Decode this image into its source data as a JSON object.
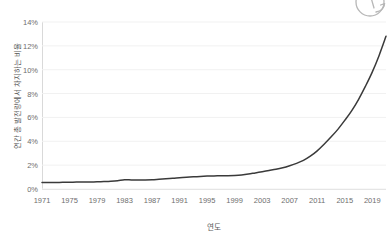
{
  "figure": {
    "background_color": "#ffffff",
    "line_color": "#3a3a3a",
    "grid_color": "#f1f1f1",
    "axis_color": "#d9d9d9",
    "tick_text_color": "#6e6e6e",
    "label_text_color": "#5a5a5a"
  },
  "icons": {
    "rotate": {
      "name": "rotate-icon",
      "label": "rotate"
    }
  },
  "chart_data": {
    "type": "line",
    "title": "",
    "subtitle": "",
    "xlabel": "연도",
    "ylabel": "연간 총 발전량에서 차지하는 비율",
    "xlim": [
      1971,
      2021
    ],
    "ylim": [
      0,
      14
    ],
    "grid": true,
    "legend": false,
    "legend_position": "none",
    "y_tick_labels": [
      "0%",
      "2%",
      "4%",
      "6%",
      "8%",
      "10%",
      "12%",
      "14%"
    ],
    "y_tick_values": [
      0,
      2,
      4,
      6,
      8,
      10,
      12,
      14
    ],
    "x_tick_labels": [
      "1971",
      "1975",
      "1979",
      "1983",
      "1987",
      "1991",
      "1995",
      "1999",
      "2003",
      "2007",
      "2011",
      "2015",
      "2019"
    ],
    "x_tick_values": [
      1971,
      1975,
      1979,
      1983,
      1987,
      1991,
      1995,
      1999,
      2003,
      2007,
      2011,
      2015,
      2019
    ],
    "series": [
      {
        "name": "연간 총 발전량에서 차지하는 비율",
        "color": "#3a3a3a",
        "x": [
          1971,
          1972,
          1973,
          1974,
          1975,
          1976,
          1977,
          1978,
          1979,
          1980,
          1981,
          1982,
          1983,
          1984,
          1985,
          1986,
          1987,
          1988,
          1989,
          1990,
          1991,
          1992,
          1993,
          1994,
          1995,
          1996,
          1997,
          1998,
          1999,
          2000,
          2001,
          2002,
          2003,
          2004,
          2005,
          2006,
          2007,
          2008,
          2009,
          2010,
          2011,
          2012,
          2013,
          2014,
          2015,
          2016,
          2017,
          2018,
          2019,
          2020,
          2021
        ],
        "values": [
          0.55,
          0.55,
          0.55,
          0.56,
          0.57,
          0.58,
          0.58,
          0.59,
          0.6,
          0.62,
          0.65,
          0.7,
          0.78,
          0.76,
          0.75,
          0.76,
          0.78,
          0.82,
          0.86,
          0.9,
          0.95,
          0.99,
          1.02,
          1.05,
          1.08,
          1.1,
          1.11,
          1.12,
          1.14,
          1.18,
          1.25,
          1.35,
          1.45,
          1.55,
          1.65,
          1.78,
          1.95,
          2.15,
          2.4,
          2.75,
          3.2,
          3.75,
          4.35,
          5.0,
          5.75,
          6.55,
          7.5,
          8.6,
          9.8,
          11.2,
          12.8
        ]
      }
    ]
  }
}
